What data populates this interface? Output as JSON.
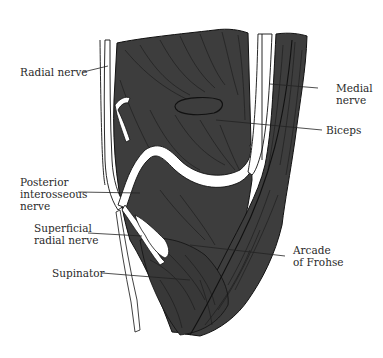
{
  "figure": {
    "colors": {
      "muscle": "#3d3d3d",
      "nerve": "#ffffff",
      "outline": "#111111",
      "leader": "#222222",
      "text": "#2a2a2a",
      "background": "#ffffff"
    }
  },
  "labels": [
    {
      "id": "radial-nerve",
      "text": "Radial nerve"
    },
    {
      "id": "medial-nerve",
      "text": "Medial\nnerve"
    },
    {
      "id": "biceps",
      "text": "Biceps"
    },
    {
      "id": "posterior-interosseous-nerve",
      "text": "Posterior\ninterosseous\nnerve"
    },
    {
      "id": "superficial-radial-nerve",
      "text": "Superficial\nradial nerve"
    },
    {
      "id": "arcade-of-frohse",
      "text": "Arcade\nof Frohse"
    },
    {
      "id": "supinator",
      "text": "Supinator"
    }
  ]
}
